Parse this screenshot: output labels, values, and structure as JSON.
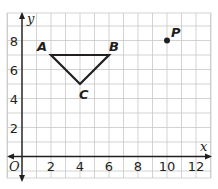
{
  "diagram": {
    "type": "coordinate-grid",
    "axes": {
      "x_label": "x",
      "y_label": "y",
      "origin_label": "O",
      "x_ticks": [
        "2",
        "4",
        "6",
        "8",
        "10",
        "12"
      ],
      "y_ticks": [
        "2",
        "4",
        "6",
        "8"
      ],
      "x_range": [
        -1,
        13
      ],
      "y_range": [
        -1.5,
        10
      ]
    },
    "triangle": {
      "vertices": [
        {
          "label": "A",
          "x": 2,
          "y": 7
        },
        {
          "label": "B",
          "x": 6,
          "y": 7
        },
        {
          "label": "C",
          "x": 4,
          "y": 5
        }
      ]
    },
    "point": {
      "label": "P",
      "x": 10,
      "y": 8
    },
    "colors": {
      "grid": "#c8c8c8",
      "axis": "#231f20",
      "shape": "#231f20",
      "background": "#ffffff"
    }
  }
}
